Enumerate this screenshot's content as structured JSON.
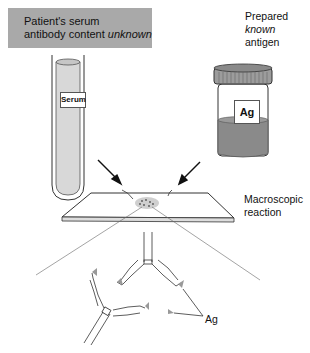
{
  "serum_box": {
    "line1": "Patient's serum",
    "line2_prefix": "antibody content ",
    "line2_emphasis": "unknown"
  },
  "antigen": {
    "line1": "Prepared",
    "line2_emphasis": "known",
    "line3": "antigen"
  },
  "tube_label": "Serum",
  "vial_label": "Ag",
  "macro_reaction": {
    "line1": "Macroscopic",
    "line2": "reaction"
  },
  "ag_callout": "Ag",
  "colors": {
    "label_box_bg": "#a9a9a9",
    "vial_fill": "#8a8a8a",
    "tube_fill": "#d8d8d8"
  }
}
